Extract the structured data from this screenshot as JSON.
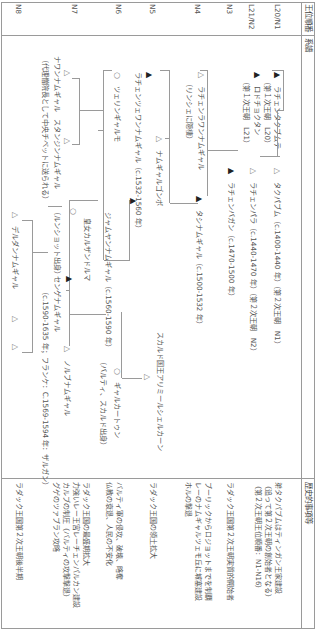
{
  "header": {
    "col_order": "王位順番",
    "col_genealogy": "系譜",
    "col_events": "歴史的事項等"
  },
  "order_labels": [
    "L20/N1",
    "L21/N2",
    "N3",
    "N4",
    "N5",
    "N6",
    "N7",
    "N8"
  ],
  "legend_symbols": {
    "filled_triangle": "▲",
    "open_triangle": "△",
    "open_circle": "○"
  },
  "persons": [
    {
      "id": "p1",
      "symbol": "▲",
      "name": "ラチェンタクブムテ",
      "note": "（第１次王朝　L20）"
    },
    {
      "id": "p2",
      "symbol": "▲",
      "name": "ロドチョクタン",
      "note": "（第１次王朝　L21）"
    },
    {
      "id": "p3",
      "symbol": "△",
      "name": "タクパブム（c.1400-1440 年）（第２次王朝　N1）"
    },
    {
      "id": "p4",
      "symbol": "△",
      "name": "ラチェンパラ（c.1440-1470 年）（第２次王朝　N2）"
    },
    {
      "id": "p5",
      "symbol": "▲",
      "name": "ラチェンバガン（c.1470-1500 年）"
    },
    {
      "id": "p6",
      "symbol": "△",
      "name": "ラチェンラワンナムギャル",
      "note": "（リンシェに隠棲）"
    },
    {
      "id": "p7",
      "symbol": "▲",
      "name": "タシナムギャル（c.1500-1532 年）"
    },
    {
      "id": "p8",
      "symbol": "△",
      "name": "ナムギャルゴンボ"
    },
    {
      "id": "p9",
      "symbol": "▲",
      "name": "ラチェンツェワンナムギャル（c.1532-1560 年）"
    },
    {
      "id": "p10",
      "symbol": "○",
      "name": "ツェリンギャルモ"
    },
    {
      "id": "p11",
      "symbol": "▲",
      "name": "ジャムヤンナムギャル（c.1560-1590 年）"
    },
    {
      "id": "p12",
      "symbol": "△",
      "name": "スカルド国王アリミールシェルカーン"
    },
    {
      "id": "p13",
      "symbol": "○",
      "name": "ギャルカートゥン",
      "note": "（バルティ、スカルド出身）"
    },
    {
      "id": "p14",
      "symbol": "△",
      "name": "ノルブナムギャル"
    },
    {
      "id": "p15",
      "symbol": "○",
      "name": "皇女カルザンドルマ",
      "note": "（ルンショット出身）"
    },
    {
      "id": "p16",
      "symbol": "▲",
      "name": "センゲナムギャル",
      "note": "（c.1590-1635 年；フランケ：C.1569-1594 年：ザルガン）"
    },
    {
      "id": "p17",
      "symbol": "△",
      "name": "ナワンナムギャル　スタンジンナムギャル",
      "note": "（代理僧院長として中央チベットに送られる）"
    },
    {
      "id": "p18",
      "symbol": "△",
      "name": "デルダンナムギャル"
    },
    {
      "id": "p19",
      "symbol": "△"
    },
    {
      "id": "p20",
      "symbol": "△"
    }
  ],
  "events": [
    {
      "row": "L20/N1",
      "lines": [
        "弟タクパブムはティンガン王家建設",
        "（追って第２次王朝の創始者となる）",
        "（第２次王朝王位順番：N1-N16）"
      ]
    },
    {
      "row": "L21/N2",
      "lines": [
        "ラダック王国第２次王朝実質的開始者"
      ]
    },
    {
      "row": "N3",
      "lines": [
        "プーリックからロジョットまでを制覇",
        "レーのナムギャルツェモ丘に城塞建設",
        "ホルの撃退"
      ]
    },
    {
      "row": "N4",
      "lines": [
        "ラダック王国の領土拡大"
      ]
    },
    {
      "row": "N5",
      "lines": [
        "バルティ軍の侵攻、破壊、略奪",
        "仏教の衰退、人民の不安化"
      ]
    },
    {
      "row": "N6",
      "lines": [
        "ラダック王国の最盛期拡大",
        "力強いレー王宮レーチェンパルカン建設",
        "カルブの制圧（バルティの攻撃撃退）",
        "グゲのツァプラン攻略"
      ]
    },
    {
      "row": "N7",
      "lines": [
        "ラダック王国第２次王朝後半期"
      ]
    }
  ]
}
